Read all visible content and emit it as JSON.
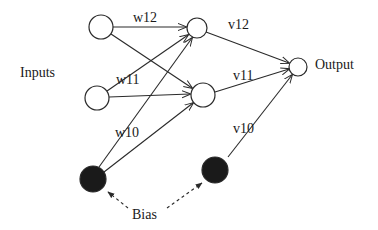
{
  "diagram": {
    "title_labels": {
      "inputs": "Inputs",
      "output": "Output",
      "bias": "Bias"
    },
    "nodes": [
      {
        "id": "input1",
        "type": "input",
        "cx": 101,
        "cy": 27,
        "r": 12,
        "filled": false
      },
      {
        "id": "input2",
        "type": "input",
        "cx": 97,
        "cy": 98,
        "r": 12,
        "filled": false
      },
      {
        "id": "bias1",
        "type": "bias",
        "cx": 93,
        "cy": 179,
        "r": 13,
        "filled": true
      },
      {
        "id": "hidden1",
        "type": "hidden",
        "cx": 197,
        "cy": 28,
        "r": 10,
        "filled": false
      },
      {
        "id": "hidden2",
        "type": "hidden",
        "cx": 203,
        "cy": 95,
        "r": 12,
        "filled": false
      },
      {
        "id": "bias2",
        "type": "bias",
        "cx": 215,
        "cy": 170,
        "r": 13,
        "filled": true
      },
      {
        "id": "output",
        "type": "output",
        "cx": 298,
        "cy": 67,
        "r": 9,
        "filled": false
      }
    ],
    "edges": [
      {
        "from": "input1",
        "to": "hidden1",
        "label": "w12"
      },
      {
        "from": "input1",
        "to": "hidden2",
        "label": ""
      },
      {
        "from": "input2",
        "to": "hidden1",
        "label": "w11"
      },
      {
        "from": "input2",
        "to": "hidden2",
        "label": ""
      },
      {
        "from": "bias1",
        "to": "hidden1",
        "label": "w10"
      },
      {
        "from": "bias1",
        "to": "hidden2",
        "label": ""
      },
      {
        "from": "hidden1",
        "to": "output",
        "label": "v12"
      },
      {
        "from": "hidden2",
        "to": "output",
        "label": "v11"
      },
      {
        "from": "bias2",
        "to": "output",
        "label": "v10"
      }
    ],
    "weight_labels": {
      "w12": "w12",
      "w11": "w11",
      "w10": "w10",
      "v12": "v12",
      "v11": "v11",
      "v10": "v10"
    },
    "colors": {
      "stroke": "#2a2a2a",
      "fill_bias": "#1a1a1a",
      "background": "#ffffff"
    }
  }
}
